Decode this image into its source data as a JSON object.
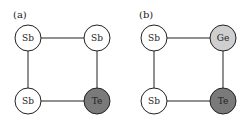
{
  "panels": [
    {
      "label": "(a)",
      "atoms": [
        {
          "symbol": "Sb",
          "fill": "#ffffff"
        },
        {
          "symbol": "Sb",
          "fill": "#ffffff"
        },
        {
          "symbol": "Sb",
          "fill": "#ffffff"
        },
        {
          "symbol": "Te",
          "fill": "#7a7a7a"
        }
      ]
    },
    {
      "label": "(b)",
      "atoms": [
        {
          "symbol": "Sb",
          "fill": "#ffffff"
        },
        {
          "symbol": "Ge",
          "fill": "#cfcfcf"
        },
        {
          "symbol": "Sb",
          "fill": "#ffffff"
        },
        {
          "symbol": "Te",
          "fill": "#7a7a7a"
        }
      ]
    }
  ]
}
